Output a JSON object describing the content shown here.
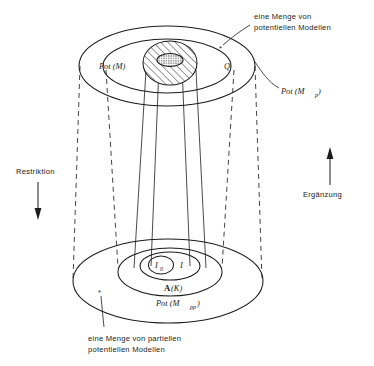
{
  "figure": {
    "background_color": "#ffffff",
    "ink_color": "#1b1b1b"
  },
  "upper_structure": {
    "name": "potential-models-structure",
    "outer_label": "Pot (M",
    "outer_label_sub": "p",
    "outer_label_close": ")",
    "middle_label": "Pot (M)",
    "region_label": "Q",
    "annotation_line1": "eine Menge von",
    "annotation_line2": "potentiellen Modellen",
    "marker": "*"
  },
  "lower_structure": {
    "name": "partial-potential-models-structure",
    "outer_label": "Pot (M",
    "outer_label_sub": "pp",
    "outer_label_close": ")",
    "middle_label": "A(K)",
    "middle_label_letter": "A",
    "middle_label_rest": "(K)",
    "inner_label": "I",
    "innermost_label": "I",
    "innermost_label_sub": "0",
    "annotation_line1": "eine Menge von partiellen",
    "annotation_line2": "potentiellen Modellen",
    "marker": "*"
  },
  "left_axis": {
    "label": "Restriktion",
    "direction": "down",
    "arrow_icon": "arrow-down-icon"
  },
  "right_axis": {
    "label": "Ergänzung",
    "direction": "up",
    "arrow_icon": "arrow-up-icon"
  }
}
